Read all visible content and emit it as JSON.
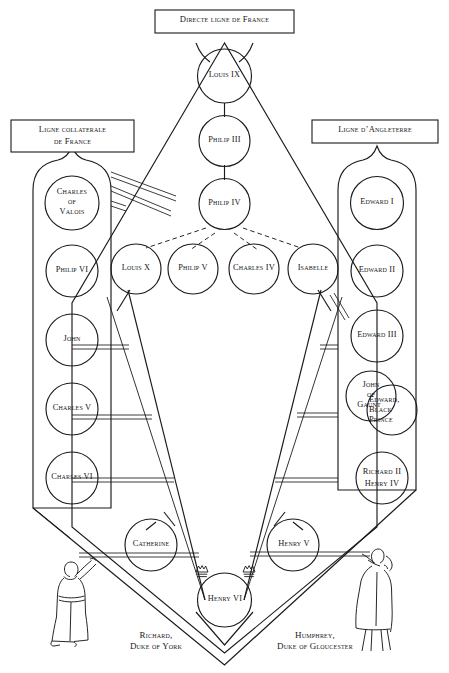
{
  "diagram": {
    "title_box": {
      "label": "Directe ligne de France"
    },
    "left_box": {
      "label_line1": "Ligne collaterale",
      "label_line2": "de France"
    },
    "right_box": {
      "label": "Ligne d’Angleterre"
    },
    "center_line": [
      {
        "id": "louis-ix",
        "label": "Louis IX"
      },
      {
        "id": "philip-iii",
        "label": "Philip III"
      },
      {
        "id": "philip-iv",
        "label": "Philip IV"
      }
    ],
    "philip_iv_children": [
      {
        "id": "louis-x",
        "label": "Louis X"
      },
      {
        "id": "philip-v",
        "label": "Philip V"
      },
      {
        "id": "charles-iv",
        "label": "Charles IV"
      },
      {
        "id": "isabelle",
        "label": "Isabelle"
      }
    ],
    "left_line": [
      {
        "id": "charles-of-valois",
        "label_line1": "Charles",
        "label_line2": "of",
        "label_line3": "Valois"
      },
      {
        "id": "philip-vi",
        "label": "Philip VI"
      },
      {
        "id": "john",
        "label": "John"
      },
      {
        "id": "charles-v",
        "label": "Charles V"
      },
      {
        "id": "charles-vi",
        "label": "Charles VI"
      }
    ],
    "right_line": [
      {
        "id": "edward-i",
        "label": "Edward I"
      },
      {
        "id": "edward-ii",
        "label": "Edward II"
      },
      {
        "id": "edward-iii",
        "label": "Edward III"
      },
      {
        "id": "john-of-gaunt",
        "label_line1": "John",
        "label_line2": "of",
        "label_line3": "Gaunt"
      },
      {
        "id": "edward-black-prince",
        "label_line1": "Edward,",
        "label_line2": "Black",
        "label_line3": "Prince"
      },
      {
        "id": "richard-ii-henry-iv",
        "label_line1": "Richard II",
        "label_line2": "Henry IV"
      }
    ],
    "bottom_line": [
      {
        "id": "catherine",
        "label": "Catherine"
      },
      {
        "id": "henry-v",
        "label": "Henry V"
      },
      {
        "id": "henry-vi",
        "label": "Henry VI"
      }
    ],
    "captions": [
      {
        "id": "richard-duke-of-york",
        "line1": "Richard,",
        "line2": "Duke of York"
      },
      {
        "id": "humphrey-duke-of-gloucester",
        "line1": "Humphrey,",
        "line2": "Duke of Gloucester"
      }
    ],
    "crowns": {
      "count": 2,
      "meaning": "crown-icon"
    },
    "figures": [
      {
        "id": "figure-left",
        "name": "standing-figure-left"
      },
      {
        "id": "figure-right",
        "name": "standing-figure-right"
      }
    ],
    "colors": {
      "ink": "#1b1b1b",
      "paper": "#ffffff"
    }
  }
}
